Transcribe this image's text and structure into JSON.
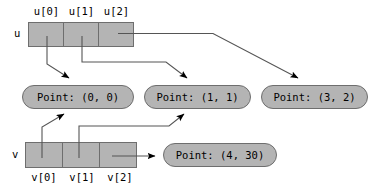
{
  "diagram": {
    "arrays": [
      {
        "name": "u",
        "name_label": "u",
        "cells": [
          {
            "index_label": "u[0]"
          },
          {
            "index_label": "u[1]"
          },
          {
            "index_label": "u[2]"
          }
        ],
        "labels_position": "above"
      },
      {
        "name": "v",
        "name_label": "v",
        "cells": [
          {
            "index_label": "v[0]"
          },
          {
            "index_label": "v[1]"
          },
          {
            "index_label": "v[2]"
          }
        ],
        "labels_position": "below"
      }
    ],
    "objects": [
      {
        "id": "p00",
        "label": "Point: (0, 0)"
      },
      {
        "id": "p11",
        "label": "Point: (1, 1)"
      },
      {
        "id": "p32",
        "label": "Point: (3, 2)"
      },
      {
        "id": "p430",
        "label": "Point: (4, 30)"
      }
    ],
    "colors": {
      "cell_fill": "#b4b4b4",
      "cell_stroke": "#6e6e6e",
      "object_fill": "#b4b4b4",
      "object_stroke": "#6e6e6e",
      "arrow_stroke": "#555555",
      "arrowhead_fill": "#000000",
      "text": "#000000",
      "background": "#ffffff"
    }
  }
}
